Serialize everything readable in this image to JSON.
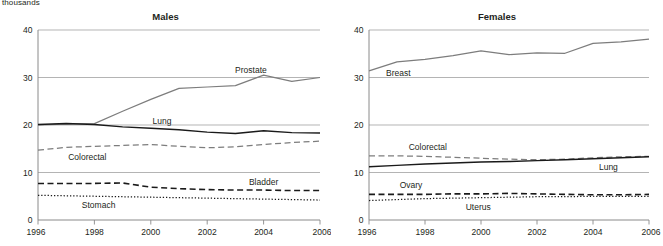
{
  "unit_label": "thousands",
  "panels": [
    {
      "key": "males",
      "title": "Males",
      "y_ticks": [
        "0",
        "10",
        "20",
        "30",
        "40"
      ],
      "x_ticks": [
        "1996",
        "1998",
        "2000",
        "2002",
        "2004",
        "2006"
      ],
      "labels": {
        "prostate": "Prostate",
        "lung": "Lung",
        "colorectal": "Colorectal",
        "bladder": "Bladder",
        "stomach": "Stomach"
      }
    },
    {
      "key": "females",
      "title": "Females",
      "y_ticks": [
        "0",
        "10",
        "20",
        "30",
        "40"
      ],
      "x_ticks": [
        "1996",
        "1998",
        "2000",
        "2002",
        "2004",
        "2006"
      ],
      "labels": {
        "breast": "Breast",
        "colorectal": "Colorectal",
        "lung": "Lung",
        "ovary": "Ovary",
        "uterus": "Uterus"
      }
    }
  ],
  "chart_data": [
    {
      "type": "line",
      "title": "Males",
      "xlabel": "",
      "ylabel": "thousands",
      "ylim": [
        0,
        40
      ],
      "yticks": [
        0,
        10,
        20,
        30,
        40
      ],
      "xlim": [
        1996,
        2006
      ],
      "xticks": [
        1996,
        1998,
        2000,
        2002,
        2004,
        2006
      ],
      "x": [
        1996,
        1997,
        1998,
        1999,
        2000,
        2001,
        2002,
        2003,
        2004,
        2005,
        2006
      ],
      "grid": "horizontal",
      "legend": "inline-labels",
      "series": [
        {
          "name": "Prostate",
          "style": "solid-gray",
          "values": [
            20.0,
            20.2,
            20.3,
            22.9,
            25.4,
            27.7,
            28.0,
            28.3,
            30.5,
            29.2,
            30.0
          ]
        },
        {
          "name": "Lung",
          "style": "solid-black",
          "values": [
            20.1,
            20.3,
            20.1,
            19.6,
            19.3,
            19.0,
            18.5,
            18.2,
            18.8,
            18.4,
            18.3
          ]
        },
        {
          "name": "Colorectal",
          "style": "dashed-gray",
          "values": [
            14.7,
            15.3,
            15.5,
            15.7,
            15.9,
            15.5,
            15.2,
            15.4,
            15.9,
            16.3,
            16.6
          ]
        },
        {
          "name": "Bladder",
          "style": "dashed-black",
          "values": [
            7.7,
            7.7,
            7.7,
            7.8,
            6.9,
            6.6,
            6.4,
            6.3,
            6.3,
            6.2,
            6.2
          ]
        },
        {
          "name": "Stomach",
          "style": "dotted-black",
          "values": [
            5.2,
            5.1,
            5.0,
            4.9,
            4.8,
            4.7,
            4.6,
            4.5,
            4.4,
            4.3,
            4.2
          ]
        }
      ]
    },
    {
      "type": "line",
      "title": "Females",
      "xlabel": "",
      "ylabel": "thousands",
      "ylim": [
        0,
        40
      ],
      "yticks": [
        0,
        10,
        20,
        30,
        40
      ],
      "xlim": [
        1996,
        2006
      ],
      "xticks": [
        1996,
        1998,
        2000,
        2002,
        2004,
        2006
      ],
      "x": [
        1996,
        1997,
        1998,
        1999,
        2000,
        2001,
        2002,
        2003,
        2004,
        2005,
        2006
      ],
      "grid": "horizontal",
      "legend": "inline-labels",
      "series": [
        {
          "name": "Breast",
          "style": "solid-gray",
          "values": [
            31.4,
            33.3,
            33.8,
            34.6,
            35.6,
            34.8,
            35.2,
            35.1,
            37.2,
            37.5,
            38.1
          ]
        },
        {
          "name": "Colorectal",
          "style": "dashed-gray",
          "values": [
            13.5,
            13.5,
            13.4,
            13.2,
            13.0,
            12.8,
            12.7,
            12.8,
            13.1,
            13.3,
            13.4
          ]
        },
        {
          "name": "Lung",
          "style": "solid-black",
          "values": [
            11.2,
            11.5,
            11.8,
            12.0,
            12.2,
            12.3,
            12.5,
            12.7,
            12.9,
            13.1,
            13.3
          ]
        },
        {
          "name": "Ovary",
          "style": "dashed-black",
          "values": [
            5.4,
            5.4,
            5.4,
            5.5,
            5.5,
            5.6,
            5.5,
            5.4,
            5.3,
            5.3,
            5.4
          ]
        },
        {
          "name": "Uterus",
          "style": "dotted-black",
          "values": [
            4.1,
            4.3,
            4.5,
            4.6,
            4.7,
            4.8,
            4.9,
            4.9,
            5.0,
            5.0,
            5.0
          ]
        }
      ]
    }
  ],
  "colors": {
    "gray_series": "#7d7d7d",
    "black_series": "#1a1a1a",
    "gridline": "#a7a7a7",
    "axis": "#8a8a8a",
    "text": "#231f20"
  }
}
